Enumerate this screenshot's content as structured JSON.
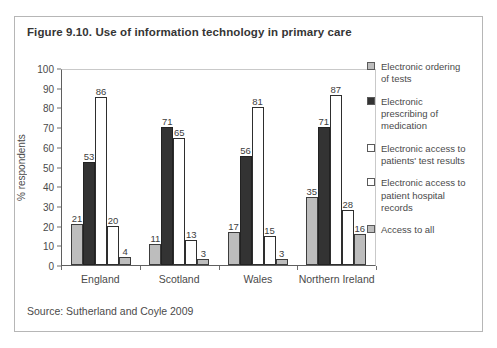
{
  "figure": {
    "title": "Figure 9.10. Use of information technology in primary care",
    "source": "Source: Sutherland and Coyle 2009"
  },
  "chart_data": {
    "type": "bar",
    "title": "Figure 9.10. Use of information technology in primary care",
    "xlabel": "",
    "ylabel": "% respondents",
    "ylim": [
      0,
      100
    ],
    "yticks": [
      0,
      10,
      20,
      30,
      40,
      50,
      60,
      70,
      80,
      90,
      100
    ],
    "grid": false,
    "legend_position": "right",
    "categories": [
      "England",
      "Scotland",
      "Wales",
      "Northern Ireland"
    ],
    "series": [
      {
        "name": "Electronic ordering of tests",
        "values": [
          21,
          11,
          17,
          35
        ],
        "fill": "#bdbdbd",
        "border": "#3c3c3c"
      },
      {
        "name": "Electronic prescribing of medication",
        "values": [
          53,
          71,
          56,
          71
        ],
        "fill": "#333333",
        "border": "#222222"
      },
      {
        "name": "Electronic access to patients' test results",
        "values": [
          86,
          65,
          81,
          87
        ],
        "fill": "#ffffff",
        "border": "#2e2e2e"
      },
      {
        "name": "Electronic access to patient hospital records",
        "values": [
          20,
          13,
          15,
          28
        ],
        "fill": "#ffffff",
        "border": "#2e2e2e"
      },
      {
        "name": "Access to all",
        "values": [
          4,
          3,
          3,
          16
        ],
        "fill": "#bdbdbd",
        "border": "#3c3c3c"
      }
    ],
    "source": "Source: Sutherland and Coyle 2009"
  }
}
